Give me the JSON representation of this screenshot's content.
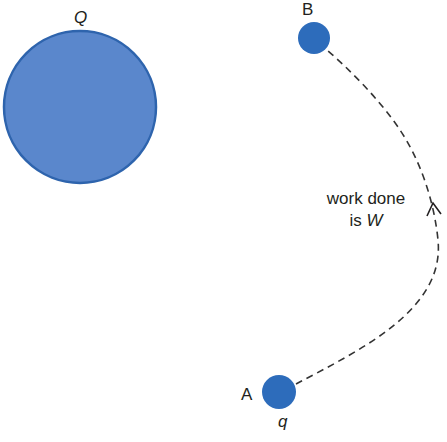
{
  "diagram": {
    "title": "",
    "colors": {
      "charge_fill": "#5a87cc",
      "charge_stroke": "#2e64ad",
      "small_charge_fill": "#2d6cbb",
      "path": "#333333",
      "text": "#231f20",
      "background": "#ffffff"
    },
    "source_charge": {
      "label": "Q",
      "center": [
        80,
        107
      ],
      "radius": 77
    },
    "point_b": {
      "label": "B",
      "center": [
        314,
        38
      ],
      "radius": 16
    },
    "point_a": {
      "label": "A",
      "charge_label": "q",
      "center": [
        279,
        392
      ],
      "radius": 17
    },
    "path": {
      "style": "dashed",
      "direction": "A to B",
      "arrow_position": [
        434,
        210
      ]
    },
    "annotation": {
      "line1": "work done",
      "line2_prefix": "is ",
      "line2_symbol": "W"
    }
  }
}
